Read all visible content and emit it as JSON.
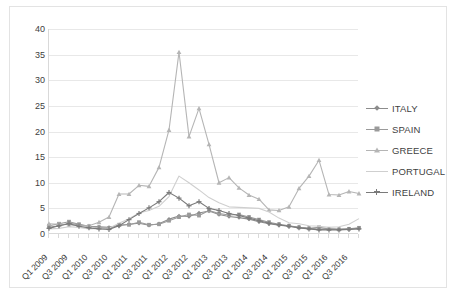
{
  "chart_data": {
    "type": "line",
    "title": "",
    "xlabel": "",
    "ylabel": "",
    "ylim": [
      0,
      40
    ],
    "ytick_step": 5,
    "yticks": [
      "0",
      "5",
      "10",
      "15",
      "20",
      "25",
      "30",
      "35",
      "40"
    ],
    "grid": true,
    "legend_position": "right",
    "x": [
      "Q1 2009",
      "Q2 2009",
      "Q3 2009",
      "Q4 2009",
      "Q1 2010",
      "Q2 2010",
      "Q3 2010",
      "Q4 2010",
      "Q1 2011",
      "Q2 2011",
      "Q3 2011",
      "Q4 2011",
      "Q1 2012",
      "Q2 2012",
      "Q3 2012",
      "Q4 2012",
      "Q1 2013",
      "Q2 2013",
      "Q3 2013",
      "Q4 2013",
      "Q1 2014",
      "Q2 2014",
      "Q3 2014",
      "Q4 2014",
      "Q1 2015",
      "Q2 2015",
      "Q3 2015",
      "Q4 2015",
      "Q1 2016",
      "Q2 2016",
      "Q3 2016",
      "Q4 2016"
    ],
    "xtick_labels": [
      "Q1 2009",
      "Q3 2009",
      "Q1 2010",
      "Q3 2010",
      "Q1 2011",
      "Q3 2011",
      "Q1 2012",
      "Q3 2012",
      "Q1 2013",
      "Q3 2013",
      "Q1 2014",
      "Q3 2014",
      "Q1 2015",
      "Q3 2015",
      "Q1 2016",
      "Q3 2016"
    ],
    "series": [
      {
        "name": "ITALY",
        "color": "#8c8c8c",
        "marker": "diamond",
        "values": [
          1.3,
          1.6,
          2.1,
          1.8,
          1.5,
          1.4,
          1.3,
          1.6,
          1.9,
          2.1,
          1.7,
          2.0,
          2.9,
          3.5,
          3.4,
          4.1,
          4.5,
          3.8,
          3.4,
          3.2,
          2.9,
          2.4,
          2.0,
          1.7,
          1.5,
          1.3,
          1.1,
          0.9,
          1.0,
          0.9,
          1.0,
          1.1
        ]
      },
      {
        "name": "SPAIN",
        "color": "#9a9a9a",
        "marker": "square",
        "values": [
          1.6,
          2.0,
          2.4,
          1.9,
          1.5,
          1.3,
          1.1,
          1.8,
          1.8,
          2.3,
          1.8,
          1.9,
          2.6,
          3.3,
          3.8,
          3.6,
          4.6,
          4.0,
          3.7,
          3.8,
          3.3,
          2.8,
          2.3,
          1.9,
          1.6,
          1.3,
          1.1,
          1.3,
          1.0,
          0.9,
          1.0,
          1.2
        ]
      },
      {
        "name": "GREECE",
        "color": "#b5b5b5",
        "marker": "triangle",
        "values": [
          2.0,
          1.9,
          1.8,
          1.6,
          1.6,
          2.3,
          3.3,
          7.8,
          7.8,
          9.5,
          9.3,
          13.0,
          20.3,
          35.5,
          19.0,
          24.5,
          17.5,
          10.0,
          11.0,
          9.0,
          7.6,
          6.8,
          4.7,
          4.6,
          5.3,
          8.9,
          11.3,
          14.4,
          7.7,
          7.6,
          8.3,
          7.9
        ]
      },
      {
        "name": "PORTUGAL",
        "color": "#cfcfcf",
        "marker": "none",
        "values": [
          1.0,
          1.1,
          1.4,
          1.3,
          1.0,
          1.1,
          1.1,
          2.1,
          3.0,
          4.1,
          4.6,
          5.4,
          7.3,
          11.3,
          10.0,
          8.6,
          7.1,
          6.1,
          5.3,
          5.2,
          5.1,
          5.0,
          4.3,
          3.1,
          2.2,
          2.0,
          1.6,
          1.5,
          1.3,
          1.4,
          1.9,
          3.0
        ]
      },
      {
        "name": "IRELAND",
        "color": "#7a7a7a",
        "marker": "plus",
        "values": [
          1.1,
          1.6,
          2.0,
          1.5,
          1.2,
          1.0,
          0.9,
          1.6,
          2.8,
          4.0,
          5.1,
          6.3,
          8.1,
          7.0,
          5.5,
          6.3,
          5.0,
          4.6,
          4.0,
          3.6,
          3.1,
          2.6,
          2.1,
          1.8,
          1.5,
          1.2,
          1.0,
          0.8,
          0.8,
          0.8,
          0.9,
          1.0
        ]
      }
    ]
  },
  "legend": {
    "items": [
      {
        "label": "ITALY"
      },
      {
        "label": "SPAIN"
      },
      {
        "label": "GREECE"
      },
      {
        "label": "PORTUGAL"
      },
      {
        "label": "IRELAND"
      }
    ]
  }
}
